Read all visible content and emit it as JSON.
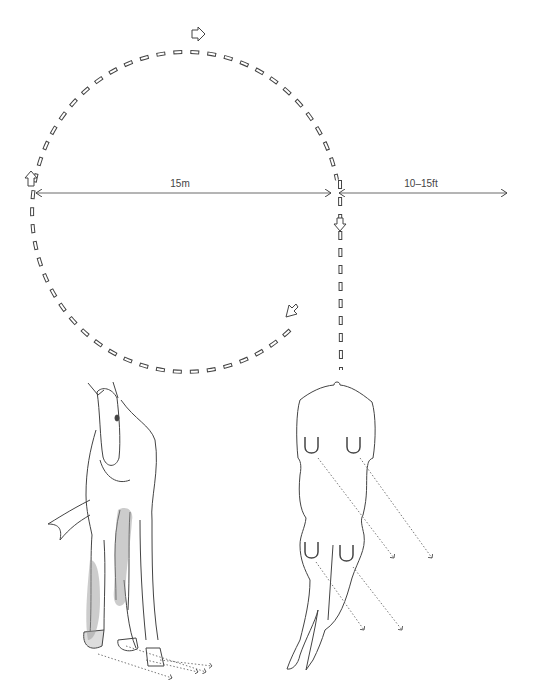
{
  "diagram": {
    "circle": {
      "diameter_label": "15m",
      "direction": "clockwise"
    },
    "straight_line": {
      "distance_label": "10–15ft"
    },
    "illustrations": [
      {
        "name": "horse-front-view",
        "caption": ""
      },
      {
        "name": "horse-overhead-hoofprints",
        "caption": ""
      }
    ],
    "colors": {
      "line": "#444444",
      "stipple": "#777777",
      "background": "#ffffff"
    }
  }
}
